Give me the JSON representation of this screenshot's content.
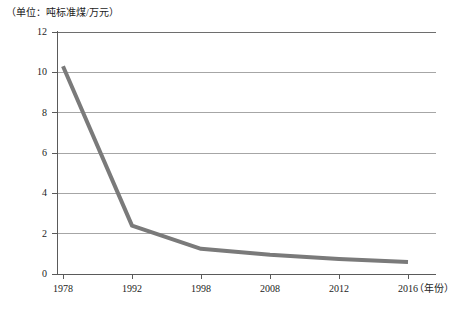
{
  "caption": {
    "unit_note": "（单位：吨标准煤/万元）"
  },
  "axes": {
    "x_axis_title": "（年份）",
    "y_axis_title": ""
  },
  "chart_data": {
    "type": "line",
    "title": "",
    "subtitle": "",
    "unit_label": "（单位：吨标准煤/万元）",
    "xlabel": "（年份）",
    "ylabel": "",
    "categories": [
      "1978",
      "1992",
      "1998",
      "2008",
      "2012",
      "2016"
    ],
    "x": [
      1978,
      1992,
      1998,
      2008,
      2012,
      2016
    ],
    "values": [
      10.3,
      2.4,
      1.25,
      0.95,
      0.75,
      0.6
    ],
    "series": [
      {
        "name": "单位GDP能耗",
        "values": [
          10.3,
          2.4,
          1.25,
          0.95,
          0.75,
          0.6
        ],
        "color": "#7a7a7a"
      }
    ],
    "ylim": [
      0,
      12
    ],
    "ytick_values": [
      0,
      2,
      4,
      6,
      8,
      10,
      12
    ],
    "ytick_labels": [
      "0",
      "2",
      "4",
      "6",
      "8",
      "10",
      "12"
    ],
    "xtick_labels": [
      "1978",
      "1992",
      "1998",
      "2008",
      "2012",
      "2016"
    ],
    "grid": true,
    "grid_axis": "y",
    "legend": false,
    "legend_position": "none",
    "markers": false,
    "line_width": 4,
    "colors": {
      "line": "#7a7a7a",
      "gridline": "#a6a6a6",
      "axis": "#5a5a5a",
      "text": "#1c1c1c",
      "background": "#ffffff"
    }
  }
}
